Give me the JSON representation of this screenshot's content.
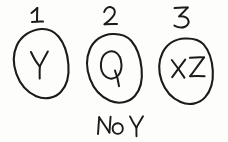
{
  "diagram": {
    "style": "hand-drawn pen sketch",
    "background_color": "#fdfdfc",
    "ink_color": "#1b1b1b",
    "groups": [
      {
        "number_label": "1",
        "contents": "Y",
        "caption": "",
        "shape": "oval"
      },
      {
        "number_label": "2",
        "contents": "Q",
        "caption": "No Y",
        "shape": "oval"
      },
      {
        "number_label": "3",
        "contents": "XZ",
        "caption": "",
        "shape": "oval"
      }
    ]
  }
}
